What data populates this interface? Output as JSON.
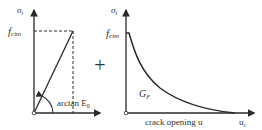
{
  "left_diagram": {
    "y_axis_label": "σ",
    "y_axis_sub": "t",
    "peak_label": "f",
    "peak_sub": "ctm",
    "angle_label": "arctan E",
    "angle_sub": "0"
  },
  "operator": "+",
  "right_diagram": {
    "y_axis_label": "σ",
    "y_axis_sub": "t",
    "peak_label": "f",
    "peak_sub": "ctm",
    "area_label": "G",
    "area_sub": "F",
    "x_axis_label": "crack opening u",
    "x_end_label": "u",
    "x_end_sub": "c"
  },
  "colors": {
    "line": "#2a2a2a",
    "text": "#333333"
  }
}
